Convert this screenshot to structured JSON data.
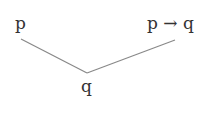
{
  "diagram": {
    "type": "proof-tree",
    "rule": "modus ponens",
    "premises": [
      {
        "label": "p"
      },
      {
        "label": "p → q"
      }
    ],
    "conclusion": {
      "label": "q"
    },
    "line_color": "#888888",
    "text_color": "#333333"
  }
}
